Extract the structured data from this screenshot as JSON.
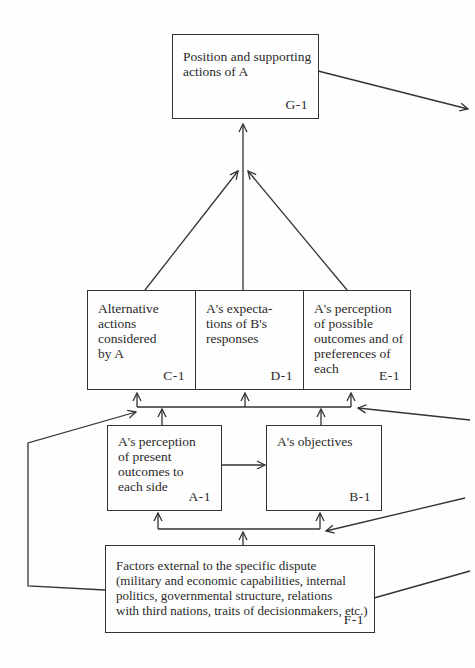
{
  "diagram": {
    "type": "flow-diagram",
    "nodes": {
      "G1": {
        "id": "G-1",
        "text": "Position and supporting\nactions of A"
      },
      "C1": {
        "id": "C-1",
        "text": "Alternative\nactions\nconsidered\nby A"
      },
      "D1": {
        "id": "D-1",
        "text": "A's expecta-\ntions of B's\nresponses"
      },
      "E1": {
        "id": "E-1",
        "text": "A's perception\nof possible\noutcomes and of\npreferences of\neach"
      },
      "A1": {
        "id": "A-1",
        "text": "A's perception\nof present\noutcomes to\neach side"
      },
      "B1": {
        "id": "B-1",
        "text": "A's objectives"
      },
      "F1": {
        "id": "F-1",
        "text": "Factors external to the specific dispute\n(military and economic capabilities, internal\npolitics, governmental structure, relations\nwith third nations, traits of decisionmakers, etc.)"
      }
    },
    "edges": [
      {
        "from": "C-1",
        "to": "G-1"
      },
      {
        "from": "D-1",
        "to": "G-1"
      },
      {
        "from": "E-1",
        "to": "G-1"
      },
      {
        "from": "A-1",
        "to": "C-1/D-1/E-1"
      },
      {
        "from": "B-1",
        "to": "C-1/D-1/E-1"
      },
      {
        "from": "A-1",
        "to": "B-1"
      },
      {
        "from": "F-1",
        "to": "A-1/B-1"
      },
      {
        "from": "F-1",
        "to": "C-1/D-1/E-1",
        "via": "left loop"
      },
      {
        "from": "off-page-right",
        "to": "C-1/D-1/E-1"
      },
      {
        "from": "off-page-right",
        "to": "A-1/B-1"
      },
      {
        "from": "F-1",
        "to": "off-page-right"
      },
      {
        "from": "G-1",
        "to": "off-page-right"
      }
    ]
  }
}
